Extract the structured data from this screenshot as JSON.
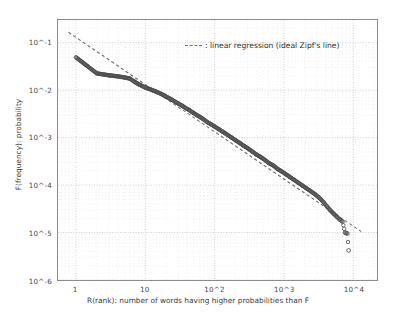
{
  "chart_data": {
    "type": "scatter",
    "title": "",
    "xlabel": "R(rank): number of words having higher probabilities than F",
    "ylabel": "F(frequency): probability",
    "xscale": "log",
    "yscale": "log",
    "xlim": [
      0.55,
      22000
    ],
    "ylim": [
      1e-06,
      0.3
    ],
    "grid": true,
    "xticks": [
      1,
      10,
      100,
      1000,
      10000
    ],
    "xticklabels": [
      "1",
      "10",
      "10^2",
      "10^3",
      "10^4"
    ],
    "yticks": [
      0.1,
      0.01,
      0.001,
      0.0001,
      1e-05,
      1e-06
    ],
    "yticklabels": [
      "10^-1",
      "10^-2",
      "10^-3",
      "10^-4",
      "10^-5",
      "10^-6"
    ],
    "legend": {
      "position": "upper-right",
      "entries": [
        {
          "marker": "dashed-line",
          "label": ": linear regression (ideal Zipf's line)"
        }
      ]
    },
    "series": [
      {
        "name": "word frequency",
        "marker": "open-circle",
        "color": "#4d4d4d",
        "points": [
          [
            1,
            0.049
          ],
          [
            2,
            0.0225
          ],
          [
            3,
            0.0205
          ],
          [
            4,
            0.0195
          ],
          [
            5,
            0.0185
          ],
          [
            6,
            0.0175
          ],
          [
            7,
            0.015
          ],
          [
            8,
            0.0133
          ],
          [
            9,
            0.0122
          ],
          [
            10,
            0.0113
          ],
          [
            11,
            0.0108
          ],
          [
            12,
            0.0103
          ],
          [
            13,
            0.0098
          ],
          [
            14,
            0.0094
          ],
          [
            15,
            0.009
          ],
          [
            17,
            0.0083
          ],
          [
            19,
            0.0076
          ],
          [
            21,
            0.007
          ],
          [
            24,
            0.0063
          ],
          [
            27,
            0.0057
          ],
          [
            30,
            0.0052
          ],
          [
            34,
            0.0047
          ],
          [
            38,
            0.0042
          ],
          [
            43,
            0.0038
          ],
          [
            48,
            0.0034
          ],
          [
            55,
            0.003
          ],
          [
            62,
            0.0027
          ],
          [
            70,
            0.0024
          ],
          [
            79,
            0.0021
          ],
          [
            89,
            0.0019
          ],
          [
            100,
            0.00171
          ],
          [
            115,
            0.0015
          ],
          [
            132,
            0.00132
          ],
          [
            151,
            0.00116
          ],
          [
            174,
            0.00101
          ],
          [
            200,
            0.00088
          ],
          [
            230,
            0.00077
          ],
          [
            264,
            0.00067
          ],
          [
            303,
            0.00059
          ],
          [
            348,
            0.00051
          ],
          [
            400,
            0.00044
          ],
          [
            460,
            0.00039
          ],
          [
            528,
            0.00034
          ],
          [
            607,
            0.00029
          ],
          [
            698,
            0.00026
          ],
          [
            802,
            0.00022
          ],
          [
            921,
            0.000195
          ],
          [
            1059,
            0.00017
          ],
          [
            1217,
            0.000148
          ],
          [
            1399,
            0.000129
          ],
          [
            1608,
            0.000112
          ],
          [
            1848,
            9.75e-05
          ],
          [
            2124,
            8.5e-05
          ],
          [
            2441,
            7.4e-05
          ],
          [
            2806,
            6.4e-05
          ],
          [
            3225,
            5.4e-05
          ],
          [
            3707,
            4.4e-05
          ],
          [
            4200,
            3.5e-05
          ],
          [
            4700,
            2.9e-05
          ],
          [
            5200,
            2.5e-05
          ],
          [
            5800,
            2.15e-05
          ],
          [
            6300,
            1.9e-05
          ],
          [
            7000,
            1.7e-05
          ],
          [
            7600,
            1e-05
          ],
          [
            8200,
            9.5e-06
          ],
          [
            8600,
            4.2e-06
          ]
        ]
      }
    ],
    "regression": {
      "name": "linear regression (ideal Zipf's line)",
      "style": "dashed",
      "color": "#6f6f6f",
      "x_start": 0.78,
      "y_start": 0.165,
      "x_end": 13000,
      "y_end": 1.05e-05,
      "slope": -1.0
    }
  }
}
